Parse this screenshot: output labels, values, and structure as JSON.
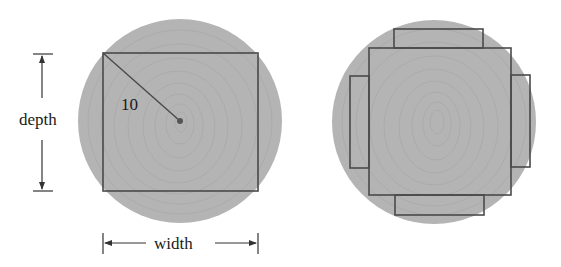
{
  "figure": {
    "left_log": {
      "radius_label": "10",
      "depth_label": "depth",
      "width_label": "width"
    },
    "right_log": {
      "planks": [
        "top",
        "bottom",
        "left",
        "right"
      ]
    },
    "colors": {
      "log_fill": "#b3b3b3",
      "ring_stroke": "#a6a6a6",
      "outline": "#4a4a4a",
      "text": "#1a1a1a"
    }
  }
}
